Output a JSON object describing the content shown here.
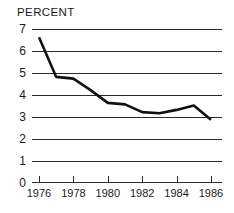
{
  "chart_data": {
    "type": "line",
    "title": "PERCENT",
    "xlabel": "",
    "ylabel": "PERCENT",
    "grid": true,
    "legend": "none",
    "xlim": [
      1976,
      1986
    ],
    "ylim": [
      0,
      7
    ],
    "yticks": [
      0,
      1,
      2,
      3,
      4,
      5,
      6,
      7
    ],
    "ytick_labels": [
      "0",
      "1",
      "2",
      "3",
      "4",
      "5",
      "6",
      "7"
    ],
    "xticks": [
      1976,
      1978,
      1980,
      1982,
      1984,
      1986
    ],
    "xtick_labels": [
      "1976",
      "1978",
      "1980",
      "1982",
      "1984",
      "1986"
    ],
    "x": [
      1976,
      1977,
      1978,
      1979,
      1980,
      1981,
      1982,
      1983,
      1984,
      1985,
      1986
    ],
    "values": [
      6.6,
      4.8,
      4.72,
      4.2,
      3.62,
      3.55,
      3.2,
      3.15,
      3.3,
      3.5,
      2.85
    ],
    "series": [
      {
        "name": "percent",
        "values": [
          6.6,
          4.8,
          4.72,
          4.2,
          3.62,
          3.55,
          3.2,
          3.15,
          3.3,
          3.5,
          2.85
        ]
      }
    ],
    "line_color": "#111111",
    "grid_color": "#2b2b2b",
    "background_color": "#ffffff"
  }
}
